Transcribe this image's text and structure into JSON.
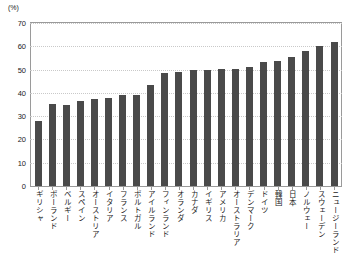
{
  "chart_data": {
    "type": "bar",
    "title": "",
    "xlabel": "",
    "ylabel": "",
    "unit_label": "(%)",
    "ylim": [
      0,
      70
    ],
    "ytick_values": [
      0,
      10,
      20,
      30,
      40,
      50,
      60,
      70
    ],
    "ytick_labels": [
      "0",
      "10",
      "20",
      "30",
      "40",
      "50",
      "60",
      "70"
    ],
    "grid": true,
    "legend": null,
    "bar_color": "#4a4a4a",
    "categories": [
      "ギリシャ",
      "ポーランド",
      "ベルギー",
      "スペイン",
      "オーストリア",
      "イタリア",
      "フランス",
      "ポルトガル",
      "アイルランド",
      "フィンランド",
      "オランダ",
      "カナダ",
      "イギリス",
      "アメリカ",
      "オーストラリア",
      "デンマーク",
      "ドイツ",
      "韓国",
      "日本",
      "ノルウェー",
      "スウェーデン",
      "ニュージーランド"
    ],
    "values": [
      27.8,
      35.2,
      35.0,
      36.6,
      37.2,
      37.9,
      38.9,
      39.0,
      43.2,
      48.5,
      48.9,
      49.8,
      50.0,
      50.1,
      50.2,
      51.0,
      53.1,
      53.5,
      55.5,
      58.0,
      60.2,
      62.0
    ]
  }
}
